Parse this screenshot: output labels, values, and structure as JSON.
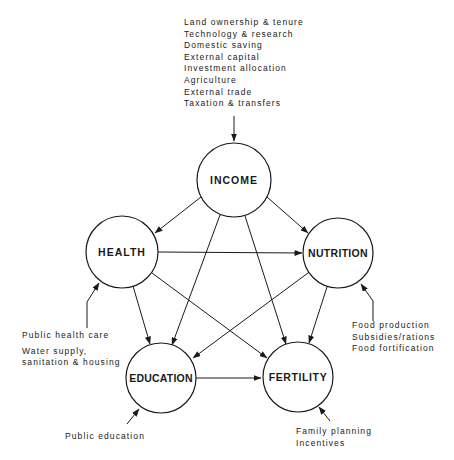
{
  "nodes": {
    "income": {
      "label": "INCOME",
      "cx": 234,
      "cy": 180,
      "r": 37
    },
    "health": {
      "label": "HEALTH",
      "cx": 122,
      "cy": 252,
      "r": 36
    },
    "nutrition": {
      "label": "NUTRITION",
      "cx": 338,
      "cy": 253,
      "r": 35
    },
    "education": {
      "label": "EDUCATION",
      "cx": 161,
      "cy": 378,
      "r": 35
    },
    "fertility": {
      "label": "FERTILITY",
      "cx": 298,
      "cy": 377,
      "r": 35
    }
  },
  "inputs": {
    "income": [
      "Land ownership & tenure",
      "Technology & research",
      "Domestic saving",
      "External capital",
      "Investment allocation",
      "Agriculture",
      "External trade",
      "Taxation & transfers"
    ],
    "health": [
      "Public health care",
      "Water supply,",
      "sanitation & housing"
    ],
    "nutrition": [
      "Food production",
      "Subsidies/rations",
      "Food fortification"
    ],
    "education": [
      "Public education"
    ],
    "fertility": [
      "Family planning",
      "Incentives"
    ]
  },
  "edges": [
    [
      "income",
      "health"
    ],
    [
      "income",
      "nutrition"
    ],
    [
      "income",
      "education"
    ],
    [
      "income",
      "fertility"
    ],
    [
      "health",
      "nutrition"
    ],
    [
      "health",
      "education"
    ],
    [
      "health",
      "fertility"
    ],
    [
      "nutrition",
      "education"
    ],
    [
      "nutrition",
      "fertility"
    ],
    [
      "education",
      "fertility"
    ]
  ],
  "colors": {
    "stroke": "#1a1a1a",
    "background": "#ffffff"
  }
}
